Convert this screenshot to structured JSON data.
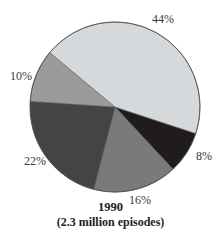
{
  "chart_data": {
    "type": "pie",
    "title": "1990",
    "subtitle": "(2.3 million episodes)",
    "start_angle_deg": 18.2,
    "direction": "clockwise",
    "slices": [
      {
        "label": "8%",
        "value": 8,
        "color": "#1f1c1b"
      },
      {
        "label": "16%",
        "value": 16,
        "color": "#7a7a7a"
      },
      {
        "label": "22%",
        "value": 22,
        "color": "#444444"
      },
      {
        "label": "10%",
        "value": 10,
        "color": "#9b9b9b"
      },
      {
        "label": "44%",
        "value": 44,
        "color": "#d6d9db"
      }
    ],
    "legend": "none",
    "labels_outside": true
  },
  "caption": {
    "year": "1990",
    "subtitle": "(2.3 million episodes)"
  },
  "geometry": {
    "cx": 115,
    "cy": 107,
    "r": 85,
    "label_positions": [
      {
        "x": 196,
        "y": 160
      },
      {
        "x": 129,
        "y": 204
      },
      {
        "x": 24,
        "y": 165
      },
      {
        "x": 10,
        "y": 80
      },
      {
        "x": 152,
        "y": 23
      }
    ]
  }
}
